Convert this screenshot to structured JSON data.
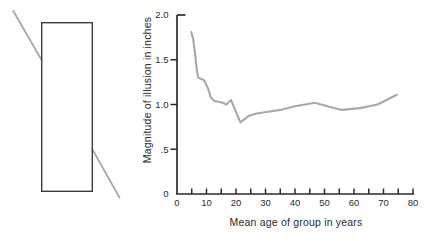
{
  "figure": {
    "colors": {
      "background": "#ffffff",
      "curve": "#a9a9a9",
      "transversal_line": "#a9a9a9",
      "rectangle_outline": "#3c3c3c",
      "axis": "#2b2b2b",
      "text": "#2b2b2b"
    }
  },
  "chart_data": {
    "type": "line",
    "title": "",
    "xlabel": "Mean age of group in years",
    "ylabel": "Magnitude of illusion in inches",
    "xlim": [
      0,
      80
    ],
    "ylim": [
      0,
      2.0
    ],
    "grid": false,
    "legend": "none",
    "x_major_ticks": [
      {
        "value": 0,
        "label": "0"
      },
      {
        "value": 10,
        "label": "10"
      },
      {
        "value": 20,
        "label": "20"
      },
      {
        "value": 30,
        "label": "30"
      },
      {
        "value": 40,
        "label": "40"
      },
      {
        "value": 50,
        "label": "50"
      },
      {
        "value": 60,
        "label": "60"
      },
      {
        "value": 70,
        "label": "70"
      },
      {
        "value": 80,
        "label": "80"
      }
    ],
    "x_minor_step": 5,
    "y_ticks": [
      {
        "value": 0,
        "label": "0"
      },
      {
        "value": 0.5,
        "label": ".5"
      },
      {
        "value": 1.0,
        "label": "1.0"
      },
      {
        "value": 1.5,
        "label": "1.5"
      },
      {
        "value": 2.0,
        "label": "2.0"
      }
    ],
    "series": [
      {
        "name": "magnitude-of-illusion-by-age",
        "color": "#a9a9a9",
        "points": [
          [
            4.8,
            1.81
          ],
          [
            5.5,
            1.73
          ],
          [
            6.2,
            1.55
          ],
          [
            6.8,
            1.36
          ],
          [
            7.2,
            1.3
          ],
          [
            9.2,
            1.27
          ],
          [
            10.5,
            1.18
          ],
          [
            11.5,
            1.08
          ],
          [
            12.5,
            1.04
          ],
          [
            14.0,
            1.03
          ],
          [
            15.5,
            1.02
          ],
          [
            16.7,
            1.0
          ],
          [
            18.3,
            1.05
          ],
          [
            21.5,
            0.8
          ],
          [
            24.2,
            0.87
          ],
          [
            27.0,
            0.9
          ],
          [
            31.0,
            0.92
          ],
          [
            35.0,
            0.94
          ],
          [
            40.0,
            0.98
          ],
          [
            46.7,
            1.02
          ],
          [
            51.0,
            0.98
          ],
          [
            55.8,
            0.94
          ],
          [
            62.0,
            0.96
          ],
          [
            68.0,
            1.0
          ],
          [
            71.0,
            1.05
          ],
          [
            74.5,
            1.11
          ]
        ]
      }
    ]
  }
}
